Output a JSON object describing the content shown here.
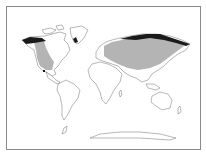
{
  "map": {
    "type": "world-distribution-map",
    "legend": [],
    "colors": {
      "background": "#ffffff",
      "border": "#8a8a8a",
      "land_outline": "#6e6e6e",
      "range_fill": "#b4b4b4",
      "dark_range_fill": "#1a1a1a"
    },
    "regions": [
      {
        "name": "north-america-range",
        "shade": "gray"
      },
      {
        "name": "eurasia-range",
        "shade": "gray"
      },
      {
        "name": "arctic-alaska-canada-band",
        "shade": "black"
      },
      {
        "name": "arctic-siberia-band",
        "shade": "black"
      },
      {
        "name": "greenland-patch",
        "shade": "black"
      },
      {
        "name": "mexico-spot",
        "shade": "black"
      }
    ]
  }
}
